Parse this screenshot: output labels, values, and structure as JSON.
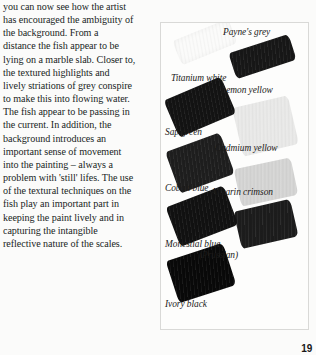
{
  "page": {
    "number": "19",
    "body_paragraph": "you can now see how the artist has encouraged the ambiguity of the background. From a distance the fish appear to be lying on a marble slab. Closer to, the textured highlights and lively striations of grey conspire to make this into flowing water. The fish appear to be passing in the current. In addition, the background introduces an important sense of movement into the painting – always a problem with 'still' lifes. The use of the textural techniques on the fish play an important part in keeping the paint lively and in capturing the intangible reflective nature of the scales.",
    "body_lines": [
      "you can now see how the artist",
      "has encouraged the ambiguity of",
      "the background. From a",
      "distance the fish appear to be",
      "lying on a marble slab. Closer to,",
      "the textured highlights and",
      "lively striations of grey conspire",
      "to make this into flowing water.",
      "The fish appear to be passing in",
      "the current. In addition, the",
      "background introduces an",
      "important sense of movement",
      "into the painting – always a",
      "problem with 'still' lifes. The use",
      "of the textural techniques on the",
      "fish play an important part in",
      "keeping the paint lively and in",
      "capturing the intangible",
      "reflective nature of the scales."
    ]
  },
  "swatch_chart": {
    "caption_style": "italic-serif",
    "swatches": [
      {
        "id": "titanium-white",
        "label": "Titanium white",
        "tone_hex": "#fbfbfa",
        "label_x": 10,
        "label_y": 50,
        "x": 14,
        "y": 6,
        "w": 60,
        "h": 26,
        "rotate": -22
      },
      {
        "id": "paynes-grey",
        "label": "Payne's grey",
        "tone_hex": "#171717",
        "label_x": 62,
        "label_y": 4,
        "x": 70,
        "y": 20,
        "w": 63,
        "h": 27,
        "rotate": -18
      },
      {
        "id": "lemon-yellow",
        "label": "Lemon yellow",
        "tone_hex": "#e9e9e8",
        "label_x": 60,
        "label_y": 62,
        "x": 76,
        "y": 78,
        "w": 57,
        "h": 50,
        "rotate": -13
      },
      {
        "id": "sap-green",
        "label": "Sap green",
        "tone_hex": "#131313",
        "label_x": 4,
        "label_y": 104,
        "x": 8,
        "y": 64,
        "w": 62,
        "h": 40,
        "rotate": -23
      },
      {
        "id": "cadmium-yellow",
        "label": "Cadmium yellow",
        "tone_hex": "#d5d5d4",
        "label_x": 54,
        "label_y": 120,
        "x": 76,
        "y": 140,
        "w": 58,
        "h": 38,
        "rotate": -12
      },
      {
        "id": "cobalt-blue",
        "label": "Cobalt blue",
        "tone_hex": "#1e1e1e",
        "label_x": 4,
        "label_y": 160,
        "x": 10,
        "y": 118,
        "w": 58,
        "h": 44,
        "rotate": -20
      },
      {
        "id": "alizarin-crimson",
        "label": "Alizarin crimson",
        "tone_hex": "#1c1c1c",
        "label_x": 50,
        "label_y": 164,
        "x": 76,
        "y": 182,
        "w": 58,
        "h": 38,
        "rotate": -13
      },
      {
        "id": "monestial-blue",
        "label": "Monestial blue",
        "label_line2": "(Prussian)",
        "tone_hex": "#111111",
        "label_x": 4,
        "label_y": 216,
        "label2_x": 38,
        "label2_y": 227,
        "x": 10,
        "y": 172,
        "w": 62,
        "h": 42,
        "rotate": -21
      },
      {
        "id": "ivory-black",
        "label": "Ivory black",
        "tone_hex": "#090909",
        "label_x": 4,
        "label_y": 276,
        "x": 10,
        "y": 228,
        "w": 60,
        "h": 44,
        "rotate": -18
      }
    ]
  }
}
